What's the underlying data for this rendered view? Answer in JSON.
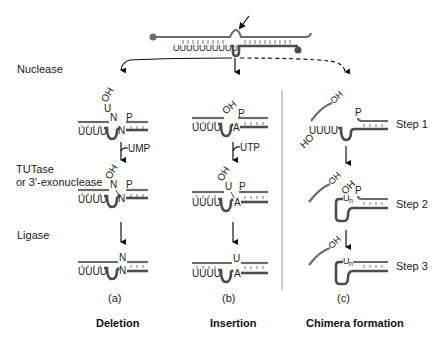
{
  "left_labels": {
    "nuclease": "Nuclease",
    "tutase": "TUTase",
    "exonuclease": "or 3'-exonuclease",
    "ligase": "Ligase"
  },
  "top_molecule": {
    "u_tail": "UUUUUUUUUU",
    "cleavage_arrow": "cleavage-site-arrow"
  },
  "panels": [
    {
      "id": "a",
      "caption": "(a)",
      "title": "Deletion",
      "step1": {
        "oh": "OH",
        "u": "U",
        "n_top": "N",
        "p": "P",
        "n_bottom": "N",
        "u_tail": "UUUU"
      },
      "cofactor": "UMP",
      "step2": {
        "oh": "OH",
        "n_top": "N",
        "p": "P",
        "n_bottom": "N",
        "u_tail": "UUUU"
      },
      "step3": {
        "n_top": "N",
        "n_bottom": "N",
        "u_tail": "UUUU"
      }
    },
    {
      "id": "b",
      "caption": "(b)",
      "title": "Insertion",
      "step1": {
        "oh": "OH",
        "p": "P",
        "a": "A",
        "u_tail": "UUUU"
      },
      "cofactor": "UTP",
      "step2": {
        "oh": "OH",
        "u": "U",
        "p": "P",
        "a": "A",
        "u_tail": "UUUU"
      },
      "step3": {
        "u": "U",
        "a": "A",
        "u_tail": "UUUU"
      }
    },
    {
      "id": "c",
      "caption": "(c)",
      "title": "Chimera formation",
      "step1": {
        "oh": "OH",
        "ho": "HO",
        "p": "P",
        "u_tail": "UUUU",
        "label": "Step 1"
      },
      "step2": {
        "oh": "OH",
        "oh2": "OH",
        "p": "P",
        "un": "U",
        "un_sub": "n",
        "label": "Step 2"
      },
      "step3": {
        "oh": "OH",
        "un": "U",
        "un_sub": "n",
        "label": "Step 3"
      }
    }
  ],
  "colors": {
    "strand": "#6a6a6a",
    "guide": "#4d4d4d",
    "text": "#222222"
  }
}
